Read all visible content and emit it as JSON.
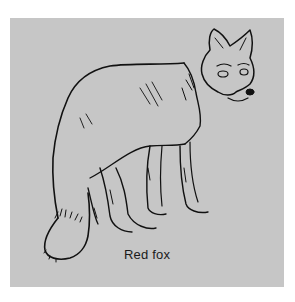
{
  "figure": {
    "caption": "Red fox",
    "colors": {
      "background": "#c6c6c6",
      "page": "#ffffff",
      "ink": "#111111"
    }
  }
}
